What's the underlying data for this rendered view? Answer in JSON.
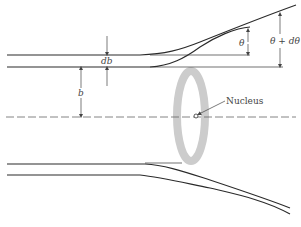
{
  "diagram": {
    "labels": {
      "impact_parameter": "b",
      "impact_parameter_width": "db",
      "scatter_angle": "θ",
      "scatter_angle_plus": "θ + dθ",
      "nucleus": "Nucleus"
    },
    "colors": {
      "ring": "#cccccc",
      "trajectory": "#2a2a2a",
      "axis": "#666666"
    }
  }
}
